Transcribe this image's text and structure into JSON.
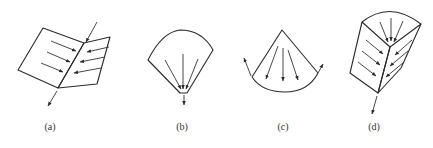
{
  "figure": {
    "panels": [
      {
        "id": "a",
        "label": "(a)",
        "shape": "folded-plane",
        "flow": "converging-to-fold-then-exit-downward"
      },
      {
        "id": "b",
        "label": "(b)",
        "shape": "fan-sector",
        "flow": "converging-to-point-exit-downward"
      },
      {
        "id": "c",
        "label": "(c)",
        "shape": "inverted-sector",
        "flow": "diverging-from-apex-exit-at-rim"
      },
      {
        "id": "d",
        "label": "(d)",
        "shape": "folded-plane-with-conical-top",
        "flow": "converging-to-fold-then-exit-downward"
      }
    ],
    "colors": {
      "line": "#2a2a2a",
      "background": "#ffffff"
    }
  }
}
